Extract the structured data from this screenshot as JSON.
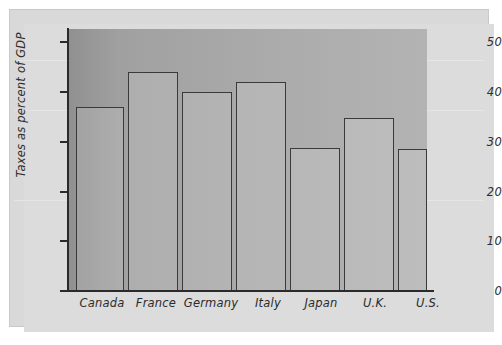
{
  "figure": {
    "background_color": "#dcdcdc",
    "plot_background_left": "#909090",
    "plot_background_right": "#b3b3b3",
    "axis_color": "#2a2a2a",
    "bar_edge_color": "#3a3a3a"
  },
  "chart_data": {
    "type": "bar",
    "title": "",
    "xlabel": "",
    "ylabel": "Taxes as percent of GDP",
    "categories": [
      "Canada",
      "France",
      "Germany",
      "Italy",
      "Japan",
      "U.K.",
      "U.S."
    ],
    "values": [
      37,
      44,
      40,
      42,
      28.7,
      34.8,
      28.6
    ],
    "yticks": [
      0,
      10,
      20,
      30,
      40,
      50
    ],
    "ytick_labels": [
      "0",
      "10",
      "20",
      "30",
      "40",
      "50"
    ],
    "ylim": [
      0,
      52.7
    ],
    "grid": false,
    "legend": false
  }
}
